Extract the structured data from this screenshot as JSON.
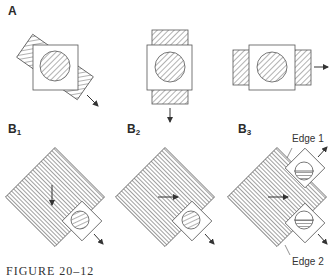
{
  "figure": {
    "caption": "FIGURE 20–12",
    "panel_a": {
      "label": "A",
      "items": [
        {
          "id": "a1",
          "band_orientation": "tilted",
          "arrow_direction": "down-right"
        },
        {
          "id": "a2",
          "band_orientation": "vertical",
          "arrow_direction": "down"
        },
        {
          "id": "a3",
          "band_orientation": "horizontal",
          "arrow_direction": "right"
        }
      ]
    },
    "panel_b": {
      "items": [
        {
          "id": "b1",
          "label_main": "B",
          "label_sub": "1",
          "inner_arrow": "down",
          "outer_arrow": "down-right"
        },
        {
          "id": "b2",
          "label_main": "B",
          "label_sub": "2",
          "inner_arrow": "right",
          "outer_arrow": "down-right"
        },
        {
          "id": "b3",
          "label_main": "B",
          "label_sub": "3",
          "inner_arrow": "right",
          "outer_arrows": [
            "up-right",
            "down-right"
          ]
        }
      ],
      "edge_labels": {
        "edge1": "Edge 1",
        "edge2": "Edge 2"
      }
    },
    "colors": {
      "stroke": "#555555",
      "hatch": "#666666",
      "background": "#ffffff"
    }
  }
}
